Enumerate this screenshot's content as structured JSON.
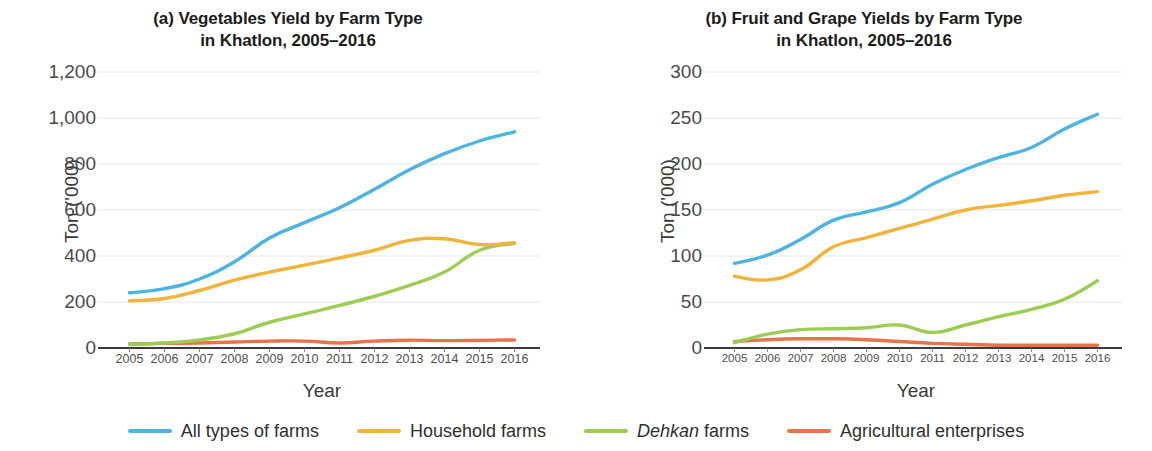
{
  "figure": {
    "legend": {
      "items": [
        {
          "label": "All types of farms",
          "color": "#4db4e2",
          "key": "all_types"
        },
        {
          "label": "Household farms",
          "color": "#f0b43c",
          "key": "household"
        },
        {
          "label": "Dehkan farms",
          "color": "#9ccc52",
          "key": "dehkan",
          "italic_word": "Dehkan",
          "rest": " farms"
        },
        {
          "label": "Agricultural enterprises",
          "color": "#e8734a",
          "key": "enterprises"
        }
      ]
    }
  },
  "panel_a": {
    "title_line1": "(a) Vegetables Yield by Farm Type",
    "title_line2": "in Khatlon, 2005–2016",
    "ylabel": "Ton ('000)",
    "xlabel": "Year",
    "yticks": [
      "1,200",
      "1,000",
      "800",
      "600",
      "400",
      "200",
      "0"
    ],
    "xticks": [
      "2005",
      "2006",
      "2007",
      "2008",
      "2009",
      "2010",
      "2011",
      "2012",
      "2013",
      "2014",
      "2015",
      "2016"
    ]
  },
  "panel_b": {
    "title_line1": "(b) Fruit and Grape Yields by Farm Type",
    "title_line2": "in Khatlon, 2005–2016",
    "ylabel": "Ton ('000)",
    "xlabel": "Year",
    "yticks": [
      "300",
      "250",
      "200",
      "150",
      "100",
      "50",
      "0"
    ],
    "xticks": [
      "2005",
      "2006",
      "2007",
      "2008",
      "2009",
      "2010",
      "2011",
      "2012",
      "2013",
      "2014",
      "2015",
      "2016"
    ]
  },
  "chart_data": [
    {
      "type": "line",
      "panel": "a",
      "title": "(a) Vegetables Yield by Farm Type in Khatlon, 2005-2016",
      "xlabel": "Year",
      "ylabel": "Ton ('000)",
      "x": [
        2005,
        2006,
        2007,
        2008,
        2009,
        2010,
        2011,
        2012,
        2013,
        2014,
        2015,
        2016
      ],
      "ylim": [
        0,
        1200
      ],
      "ytick_values": [
        0,
        200,
        400,
        600,
        800,
        1000,
        1200
      ],
      "grid": "horizontal",
      "legend_position": "bottom-shared",
      "series": [
        {
          "name": "All types of farms",
          "color": "#4db4e2",
          "values": [
            240,
            258,
            300,
            375,
            478,
            545,
            610,
            690,
            775,
            845,
            900,
            940
          ]
        },
        {
          "name": "Household farms",
          "color": "#f0b43c",
          "values": [
            205,
            215,
            250,
            295,
            330,
            360,
            392,
            425,
            468,
            475,
            450,
            458
          ]
        },
        {
          "name": "Dehkan farms",
          "color": "#9ccc52",
          "values": [
            15,
            22,
            35,
            62,
            112,
            148,
            185,
            225,
            272,
            330,
            425,
            455
          ]
        },
        {
          "name": "Agricultural enterprises",
          "color": "#e8734a",
          "values": [
            18,
            20,
            22,
            26,
            30,
            30,
            22,
            30,
            34,
            32,
            33,
            35
          ]
        }
      ]
    },
    {
      "type": "line",
      "panel": "b",
      "title": "(b) Fruit and Grape Yields by Farm Type in Khatlon, 2005-2016",
      "xlabel": "Year",
      "ylabel": "Ton ('000)",
      "x": [
        2005,
        2006,
        2007,
        2008,
        2009,
        2010,
        2011,
        2012,
        2013,
        2014,
        2015,
        2016
      ],
      "ylim": [
        0,
        300
      ],
      "ytick_values": [
        0,
        50,
        100,
        150,
        200,
        250,
        300
      ],
      "grid": "horizontal",
      "legend_position": "bottom-shared",
      "series": [
        {
          "name": "All types of farms",
          "color": "#4db4e2",
          "values": [
            92,
            101,
            118,
            139,
            148,
            158,
            178,
            194,
            207,
            218,
            238,
            254
          ]
        },
        {
          "name": "Household farms",
          "color": "#f0b43c",
          "values": [
            78,
            74,
            85,
            110,
            120,
            130,
            140,
            150,
            155,
            160,
            166,
            170
          ]
        },
        {
          "name": "Dehkan farms",
          "color": "#9ccc52",
          "values": [
            6,
            15,
            20,
            21,
            22,
            25,
            17,
            25,
            34,
            42,
            53,
            73
          ]
        },
        {
          "name": "Agricultural enterprises",
          "color": "#e8734a",
          "values": [
            7,
            9,
            10,
            10,
            9,
            7,
            5,
            4,
            3,
            3,
            3,
            3
          ]
        }
      ]
    }
  ]
}
